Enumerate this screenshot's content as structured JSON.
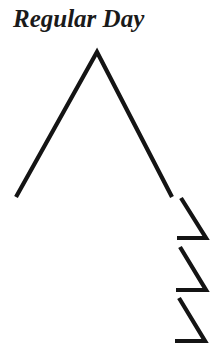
{
  "title": "Regular Day",
  "colors": {
    "background": "#ffffff",
    "stroke": "#141414",
    "text": "#1a1a1a"
  },
  "diagram": {
    "peak": {
      "left_base": [
        16,
        197
      ],
      "apex": [
        97,
        52
      ],
      "right_base": [
        172,
        197
      ]
    },
    "zigzags": [
      {
        "diag_start": [
          181,
          198
        ],
        "corner": [
          206,
          238
        ],
        "horiz_end": [
          177,
          238
        ]
      },
      {
        "diag_start": [
          180,
          247
        ],
        "corner": [
          206,
          290
        ],
        "horiz_end": [
          176,
          290
        ]
      },
      {
        "diag_start": [
          179,
          298
        ],
        "corner": [
          205,
          341
        ],
        "horiz_end": [
          175,
          341
        ]
      }
    ]
  }
}
